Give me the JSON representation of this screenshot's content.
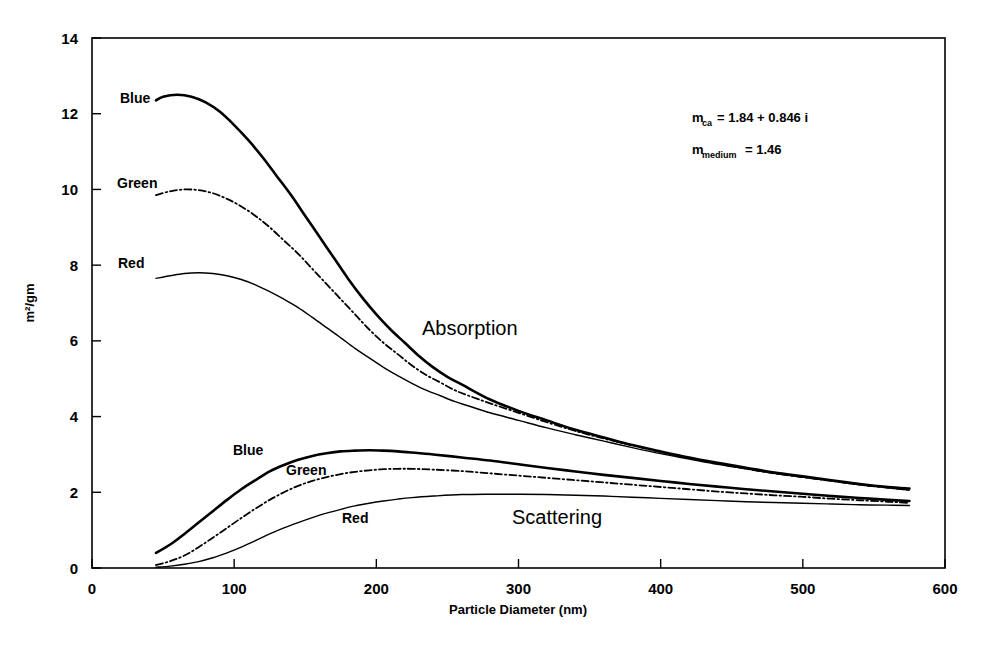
{
  "chart_data": {
    "type": "line",
    "title": "",
    "xlabel": "Particle Diameter (nm)",
    "ylabel": "m2/gm",
    "ylabel_display": "m²/gm",
    "xlim": [
      0,
      600
    ],
    "ylim": [
      0,
      14
    ],
    "xticks": [
      0,
      100,
      200,
      300,
      400,
      500,
      600
    ],
    "yticks": [
      0,
      2,
      4,
      6,
      8,
      10,
      12,
      14
    ],
    "grid": false,
    "legend_position": "inline-curve-labels",
    "region_labels": [
      "Absorption",
      "Scattering"
    ],
    "annotations": [
      "m_ca = 1.84 + 0.846 i",
      "m_medium = 1.46"
    ],
    "series": [
      {
        "name": "Blue Absorption",
        "group": "Absorption",
        "label": "Blue",
        "style": "solid-thick",
        "x": [
          45,
          50,
          60,
          70,
          80,
          90,
          100,
          110,
          120,
          130,
          140,
          150,
          160,
          170,
          180,
          190,
          200,
          210,
          220,
          230,
          240,
          250,
          260,
          280,
          300,
          320,
          340,
          360,
          380,
          400,
          420,
          440,
          460,
          480,
          500,
          520,
          540,
          560,
          575
        ],
        "y": [
          12.35,
          12.45,
          12.5,
          12.45,
          12.3,
          12.05,
          11.7,
          11.3,
          10.85,
          10.35,
          9.85,
          9.3,
          8.75,
          8.2,
          7.65,
          7.15,
          6.7,
          6.3,
          5.95,
          5.6,
          5.3,
          5.05,
          4.85,
          4.45,
          4.15,
          3.9,
          3.65,
          3.45,
          3.25,
          3.08,
          2.92,
          2.78,
          2.65,
          2.52,
          2.42,
          2.32,
          2.22,
          2.14,
          2.1
        ]
      },
      {
        "name": "Green Absorption",
        "group": "Absorption",
        "label": "Green",
        "style": "dash-dot",
        "x": [
          45,
          55,
          65,
          75,
          85,
          95,
          105,
          115,
          125,
          135,
          145,
          155,
          165,
          175,
          185,
          195,
          205,
          215,
          225,
          235,
          245,
          255,
          265,
          280,
          300,
          320,
          340,
          360,
          380,
          400,
          420,
          440,
          460,
          480,
          500,
          520,
          540,
          560,
          575
        ],
        "y": [
          9.85,
          9.95,
          10.0,
          9.98,
          9.9,
          9.75,
          9.55,
          9.3,
          9.0,
          8.65,
          8.3,
          7.9,
          7.5,
          7.1,
          6.7,
          6.3,
          5.95,
          5.65,
          5.35,
          5.1,
          4.9,
          4.7,
          4.55,
          4.35,
          4.1,
          3.85,
          3.62,
          3.42,
          3.24,
          3.06,
          2.9,
          2.76,
          2.62,
          2.5,
          2.4,
          2.3,
          2.2,
          2.12,
          2.06
        ]
      },
      {
        "name": "Red Absorption",
        "group": "Absorption",
        "label": "Red",
        "style": "thin",
        "x": [
          45,
          55,
          65,
          75,
          85,
          95,
          105,
          115,
          125,
          135,
          145,
          155,
          165,
          175,
          185,
          195,
          205,
          215,
          225,
          235,
          245,
          255,
          265,
          280,
          300,
          320,
          340,
          360,
          380,
          400,
          420,
          440,
          460,
          480,
          500,
          520,
          540,
          560,
          575
        ],
        "y": [
          7.65,
          7.72,
          7.78,
          7.8,
          7.78,
          7.72,
          7.62,
          7.48,
          7.3,
          7.1,
          6.88,
          6.62,
          6.35,
          6.08,
          5.8,
          5.55,
          5.3,
          5.08,
          4.88,
          4.7,
          4.55,
          4.4,
          4.28,
          4.1,
          3.9,
          3.7,
          3.52,
          3.35,
          3.18,
          3.02,
          2.88,
          2.74,
          2.62,
          2.5,
          2.4,
          2.3,
          2.2,
          2.12,
          2.06
        ]
      },
      {
        "name": "Blue Scattering",
        "group": "Scattering",
        "label": "Blue",
        "style": "solid-thick",
        "x": [
          45,
          55,
          65,
          75,
          85,
          95,
          105,
          115,
          125,
          135,
          145,
          155,
          165,
          175,
          185,
          195,
          205,
          215,
          225,
          240,
          260,
          280,
          300,
          320,
          340,
          360,
          380,
          400,
          420,
          440,
          460,
          480,
          500,
          520,
          540,
          560,
          575
        ],
        "y": [
          0.4,
          0.62,
          0.9,
          1.2,
          1.5,
          1.8,
          2.08,
          2.32,
          2.55,
          2.72,
          2.86,
          2.96,
          3.03,
          3.08,
          3.1,
          3.11,
          3.1,
          3.08,
          3.05,
          3.0,
          2.92,
          2.84,
          2.74,
          2.64,
          2.55,
          2.46,
          2.38,
          2.3,
          2.22,
          2.15,
          2.08,
          2.02,
          1.96,
          1.9,
          1.85,
          1.8,
          1.77
        ]
      },
      {
        "name": "Green Scattering",
        "group": "Scattering",
        "label": "Green",
        "style": "dash-dot",
        "x": [
          45,
          55,
          65,
          75,
          85,
          95,
          105,
          115,
          125,
          135,
          145,
          155,
          165,
          175,
          185,
          195,
          205,
          215,
          225,
          240,
          260,
          280,
          300,
          320,
          340,
          360,
          380,
          400,
          420,
          440,
          460,
          480,
          500,
          520,
          540,
          560,
          575
        ],
        "y": [
          0.08,
          0.18,
          0.33,
          0.55,
          0.8,
          1.06,
          1.32,
          1.57,
          1.8,
          2.0,
          2.17,
          2.3,
          2.4,
          2.48,
          2.54,
          2.58,
          2.61,
          2.62,
          2.62,
          2.6,
          2.56,
          2.5,
          2.44,
          2.38,
          2.32,
          2.26,
          2.2,
          2.14,
          2.08,
          2.02,
          1.97,
          1.92,
          1.88,
          1.83,
          1.79,
          1.75,
          1.72
        ]
      },
      {
        "name": "Red Scattering",
        "group": "Scattering",
        "label": "Red",
        "style": "thin",
        "x": [
          45,
          55,
          65,
          75,
          85,
          95,
          105,
          115,
          125,
          135,
          145,
          155,
          165,
          175,
          185,
          195,
          205,
          215,
          225,
          240,
          260,
          280,
          300,
          320,
          340,
          360,
          380,
          400,
          420,
          440,
          460,
          480,
          500,
          520,
          540,
          560,
          575
        ],
        "y": [
          0.02,
          0.05,
          0.1,
          0.17,
          0.27,
          0.4,
          0.55,
          0.72,
          0.9,
          1.06,
          1.2,
          1.33,
          1.45,
          1.55,
          1.64,
          1.71,
          1.77,
          1.82,
          1.86,
          1.9,
          1.94,
          1.95,
          1.95,
          1.94,
          1.92,
          1.9,
          1.87,
          1.84,
          1.81,
          1.78,
          1.75,
          1.73,
          1.71,
          1.69,
          1.67,
          1.66,
          1.65
        ]
      }
    ]
  },
  "axis": {
    "y_tick_labels": [
      "0",
      "2",
      "4",
      "6",
      "8",
      "10",
      "12",
      "14"
    ],
    "x_tick_labels": [
      "0",
      "100",
      "200",
      "300",
      "400",
      "500",
      "600"
    ],
    "y_title": "m²/gm",
    "x_title": "Particle Diameter (nm)"
  },
  "labels": {
    "absorption": "Absorption",
    "scattering": "Scattering",
    "abs_blue": "Blue",
    "abs_green": "Green",
    "abs_red": "Red",
    "sca_blue": "Blue",
    "sca_green": "Green",
    "sca_red": "Red"
  },
  "annotation": {
    "line1_base": "m",
    "line1_sub": "ca",
    "line1_rest": "= 1.84 + 0.846 i",
    "line2_base": "m",
    "line2_sub": "medium",
    "line2_rest": "= 1.46"
  },
  "colors": {
    "ink": "#000000",
    "background": "#ffffff"
  }
}
